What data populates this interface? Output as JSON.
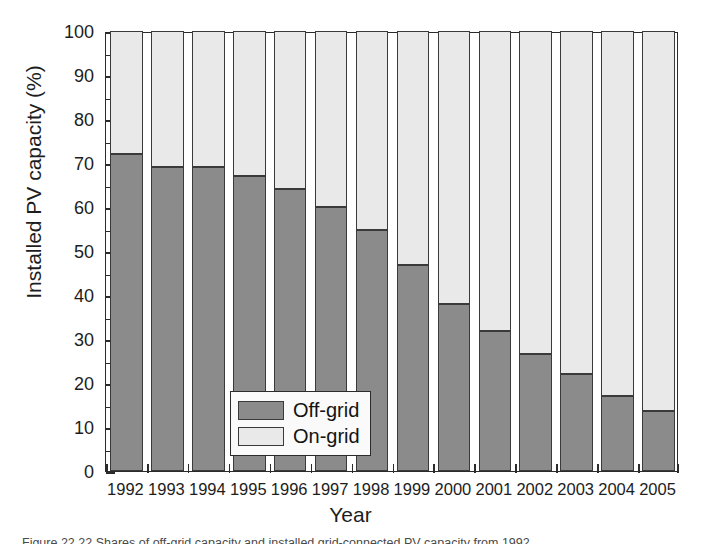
{
  "chart_data": {
    "type": "bar",
    "subtype": "stacked-100-percent",
    "title": "",
    "xlabel": "Year",
    "ylabel": "Installed PV capacity (%)",
    "categories": [
      "1992",
      "1993",
      "1994",
      "1995",
      "1996",
      "1997",
      "1998",
      "1999",
      "2000",
      "2001",
      "2002",
      "2003",
      "2004",
      "2005"
    ],
    "series": [
      {
        "name": "Off-grid",
        "color": "#8b8b8b",
        "values": [
          72,
          69,
          69,
          67,
          64,
          60,
          54.8,
          46.8,
          38,
          31.8,
          26.7,
          22,
          17,
          13.7
        ]
      },
      {
        "name": "On-grid",
        "color": "#e9e9e9",
        "values": [
          28,
          31,
          31,
          33,
          36,
          40,
          45.2,
          53.2,
          62,
          68.2,
          73.3,
          78,
          83,
          86.3
        ]
      }
    ],
    "ylim": [
      0,
      100
    ],
    "yticks": [
      0,
      10,
      20,
      30,
      40,
      50,
      60,
      70,
      80,
      90,
      100
    ],
    "ytick_labels": [
      "0",
      "10",
      "20",
      "30",
      "40",
      "50",
      "60",
      "70",
      "80",
      "90",
      "100"
    ],
    "y_minor_tick_step": 5,
    "grid": false,
    "legend_position": "inside-lower-left",
    "legend_entries": [
      "Off-grid",
      "On-grid"
    ],
    "axis_color": "#2b2b2b",
    "background": "#ffffff"
  },
  "axis": {
    "y_title": "Installed PV capacity (%)",
    "x_title": "Year"
  },
  "legend": {
    "items": [
      {
        "label": "Off-grid",
        "swatch": "dark-gray-swatch"
      },
      {
        "label": "On-grid",
        "swatch": "light-gray-swatch"
      }
    ]
  },
  "caption": {
    "text": "Figure 22.22  Shares of off-grid capacity and installed grid-connected PV capacity from 1992"
  }
}
